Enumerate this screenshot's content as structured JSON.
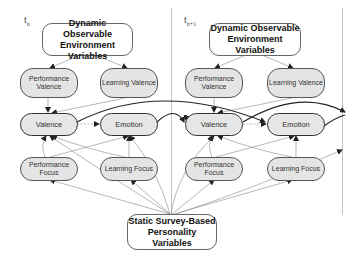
{
  "time_slices": [
    {
      "label": "t",
      "subscript": "n"
    },
    {
      "label": "t",
      "subscript": "n+1"
    }
  ],
  "nodes": {
    "dynamic": "Dynamic Observable Environment Variables",
    "dynamic_line1": "Dynamic Observable",
    "dynamic_line2": "Environment Variables",
    "performance_valence_line1": "Performance",
    "performance_valence_line2": "Valence",
    "learning_valence": "Learning Valence",
    "valence": "Valence",
    "emotion": "Emotion",
    "performance_focus_line1": "Performance",
    "performance_focus_line2": "Focus",
    "learning_focus": "Learning Focus",
    "static_line1": "Static Survey-Based",
    "static_line2": "Personality Variables"
  },
  "edges": [
    {
      "from": "Dynamic Observable Environment Variables",
      "to": "Performance Valence"
    },
    {
      "from": "Dynamic Observable Environment Variables",
      "to": "Learning Valence"
    },
    {
      "from": "Performance Valence",
      "to": "Valence"
    },
    {
      "from": "Learning Valence",
      "to": "Valence"
    },
    {
      "from": "Valence",
      "to": "Emotion",
      "style": "dashed"
    },
    {
      "from": "Performance Focus",
      "to": "Valence"
    },
    {
      "from": "Performance Focus",
      "to": "Emotion"
    },
    {
      "from": "Learning Focus",
      "to": "Valence"
    },
    {
      "from": "Learning Focus",
      "to": "Emotion"
    },
    {
      "from": "Static Survey-Based Personality Variables",
      "to": "Valence"
    },
    {
      "from": "Static Survey-Based Personality Variables",
      "to": "Emotion"
    },
    {
      "from": "Static Survey-Based Personality Variables",
      "to": "Performance Focus"
    },
    {
      "from": "Static Survey-Based Personality Variables",
      "to": "Learning Focus"
    },
    {
      "from": "Valence (t_n)",
      "to": "Emotion (t_n+1)",
      "style": "bold"
    },
    {
      "from": "Emotion (t_n)",
      "to": "Valence (t_n+1)",
      "style": "bold"
    }
  ]
}
